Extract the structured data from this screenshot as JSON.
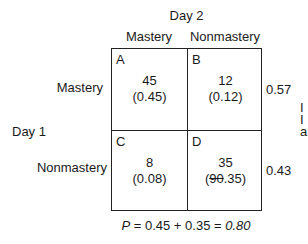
{
  "column_header": "Day 2",
  "row_header": "Day 1",
  "columns": [
    "Mastery",
    "Nonmastery"
  ],
  "rows": [
    "Mastery",
    "Nonmastery"
  ],
  "cells": [
    {
      "letter": "A",
      "count": "45",
      "proportion": "(0.45)"
    },
    {
      "letter": "B",
      "count": "12",
      "proportion": "(0.12)"
    },
    {
      "letter": "C",
      "count": "8",
      "proportion": "(0.08)"
    },
    {
      "letter": "D",
      "count": "35",
      "proportion_prefix": "(",
      "proportion_strike": "90",
      "proportion_rest": ".35)"
    }
  ],
  "row_totals": [
    "0.57",
    "0.43"
  ],
  "formula": {
    "p": "P",
    "expr": " = 0.45 + 0.35 = ",
    "result": "0.80"
  },
  "edge_text": [
    "I",
    "I",
    "a"
  ]
}
